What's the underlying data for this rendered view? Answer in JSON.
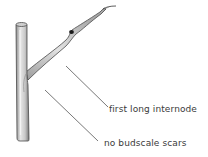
{
  "figure": {
    "labels": [
      {
        "id": "internode",
        "text": "first long internode"
      },
      {
        "id": "budscale",
        "text": "no budscale scars"
      }
    ]
  },
  "colors": {
    "background": "#ffffff",
    "stem_fill": "#d9d9d9",
    "stem_shade": "#9a9a9a",
    "stem_outline": "#4a4a4a",
    "bud": "#1a1a1a",
    "leader_line": "#555555",
    "label_text": "#3a3a3a"
  }
}
